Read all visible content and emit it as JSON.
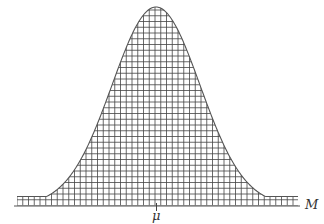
{
  "chart_data": {
    "type": "area",
    "title": "",
    "xlabel": "M",
    "ylabel": "",
    "x_ticks": [
      {
        "position": "mean",
        "label": "μ"
      }
    ],
    "distribution": {
      "kind": "normal",
      "mean_label": "μ",
      "mean": 0,
      "std": 1
    },
    "x_range_in_std": [
      -3.2,
      3.2
    ],
    "grid": "hatched fill only",
    "legend": "none",
    "fill_pattern": "square grid",
    "colors": {
      "curve": "#555555",
      "grid": "#444444",
      "axis": "#555555",
      "background": "#ffffff"
    }
  },
  "labels": {
    "axis": "M",
    "mean": "μ"
  }
}
